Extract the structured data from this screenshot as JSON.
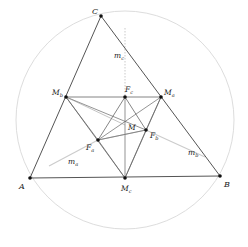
{
  "diagram": {
    "colors": {
      "triangle": "#555555",
      "inner_lines": "#666666",
      "median_dotted": "#bbbbbb",
      "circle": "#dddddd",
      "point": "#111111",
      "label": "#222222"
    },
    "circle": {
      "cx": 125,
      "cy": 120,
      "r": 109
    },
    "points": {
      "A": {
        "x": 30,
        "y": 178,
        "label": "A",
        "sub": "",
        "lx": 19,
        "ly": 189
      },
      "B": {
        "x": 220,
        "y": 176,
        "label": "B",
        "sub": "",
        "lx": 224,
        "ly": 187
      },
      "C": {
        "x": 101,
        "y": 16,
        "label": "C",
        "sub": "",
        "lx": 92,
        "ly": 14
      },
      "Ma": {
        "x": 161,
        "y": 97,
        "label": "M",
        "sub": "a",
        "lx": 164,
        "ly": 95
      },
      "Mb": {
        "x": 66,
        "y": 97,
        "label": "M",
        "sub": "b",
        "lx": 52,
        "ly": 95
      },
      "Mc": {
        "x": 125,
        "y": 178,
        "label": "M",
        "sub": "c",
        "lx": 121,
        "ly": 191
      },
      "Fa": {
        "x": 98,
        "y": 140,
        "label": "F",
        "sub": "a",
        "lx": 86,
        "ly": 150
      },
      "Fb": {
        "x": 146,
        "y": 130,
        "label": "F",
        "sub": "b",
        "lx": 150,
        "ly": 138
      },
      "Fc": {
        "x": 125,
        "y": 97,
        "label": "F",
        "sub": "c",
        "lx": 125,
        "ly": 92
      },
      "M": {
        "x": 125,
        "y": 125,
        "label": "M",
        "sub": "",
        "lx": 128,
        "ly": 130
      }
    },
    "median_labels": {
      "ma": {
        "text": "m",
        "sub": "a",
        "x": 68,
        "y": 164
      },
      "mb": {
        "text": "m",
        "sub": "b",
        "x": 188,
        "y": 155
      },
      "mc": {
        "text": "m",
        "sub": "c",
        "x": 114,
        "y": 58
      }
    }
  }
}
